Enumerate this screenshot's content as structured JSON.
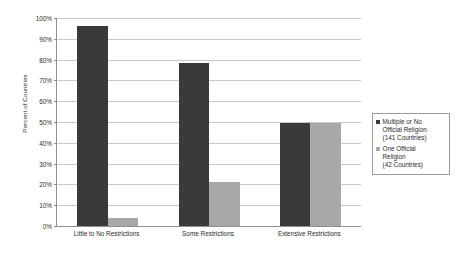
{
  "chart_data": {
    "type": "bar",
    "title": "",
    "subtitle": "",
    "xlabel": "",
    "ylabel": "Percent of Countries",
    "ylim": [
      0,
      100
    ],
    "ytick_labels": [
      "0%",
      "10%",
      "20%",
      "30%",
      "40%",
      "50%",
      "60%",
      "70%",
      "80%",
      "90%",
      "100%"
    ],
    "ytick_values": [
      0,
      10,
      20,
      30,
      40,
      50,
      60,
      70,
      80,
      90,
      100
    ],
    "grid": true,
    "legend_position": "right",
    "categories": [
      "Little to No Restrictions",
      "Some Restrictions",
      "Extensive Restrictions"
    ],
    "series": [
      {
        "name": "Multiple or No Official Religion (141 Countries)",
        "legend_label": "Multiple or No\nOfficial Religion\n(141 Countries)",
        "color": "#3a3a3a",
        "values": [
          96,
          78.5,
          49.5
        ]
      },
      {
        "name": "One Official Religion (42 Countries)",
        "legend_label": "One Official\nReligion\n(42 Countries)",
        "color": "#a8a8a8",
        "values": [
          3.8,
          21,
          49.5
        ]
      }
    ]
  },
  "colors": {
    "series_dark": "#3a3a3a",
    "series_light": "#a8a8a8",
    "gridline": "#c9c9c9",
    "axis": "#8f8f8f",
    "text": "#2b2b2b",
    "background": "#ffffff"
  }
}
